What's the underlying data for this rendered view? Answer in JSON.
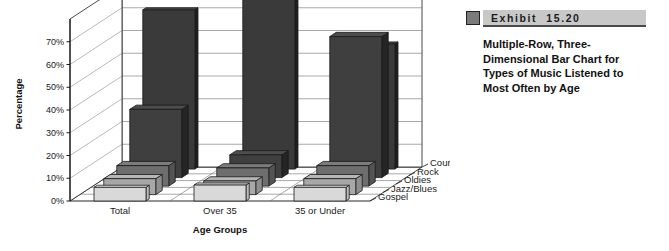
{
  "exhibit": {
    "label": "Exhibit",
    "number": "15.20",
    "caption": "Multiple-Row, Three-Dimensional Bar Chart for Types of Music Listened to Most Often by Age",
    "swatch_color": "#7b7b7b",
    "bar_color": "#c8c8c8"
  },
  "chart_data": {
    "type": "bar",
    "title": "",
    "subtitle": "",
    "xlabel": "Age Groups",
    "ylabel": "Percentage",
    "zlabel": "",
    "categories": [
      "Total",
      "Over 35",
      "35 or Under"
    ],
    "ytick_labels": [
      "0%",
      "10%",
      "20%",
      "30%",
      "40%",
      "50%",
      "60%",
      "70%"
    ],
    "ytick_values": [
      0,
      10,
      20,
      30,
      40,
      50,
      60,
      70
    ],
    "ylim": [
      0,
      80
    ],
    "grid": true,
    "legend_position": "depth-axis-right",
    "three_dimensional": true,
    "row_order_back_to_front": [
      "Country",
      "Rock",
      "Oldies",
      "Jazz/Blues",
      "Gospel"
    ],
    "series": [
      {
        "name": "Country",
        "color": "#3a3a3a",
        "values": [
          70,
          85,
          55
        ]
      },
      {
        "name": "Rock",
        "color": "#3f3f3f",
        "values": [
          30,
          10,
          62
        ]
      },
      {
        "name": "Oldies",
        "color": "#6e6e6e",
        "values": [
          9,
          8,
          9
        ]
      },
      {
        "name": "Jazz/Blues",
        "color": "#a8a8a8",
        "values": [
          7,
          6,
          7
        ]
      },
      {
        "name": "Gospel",
        "color": "#d9d9d9",
        "values": [
          6,
          7,
          6
        ]
      }
    ]
  }
}
